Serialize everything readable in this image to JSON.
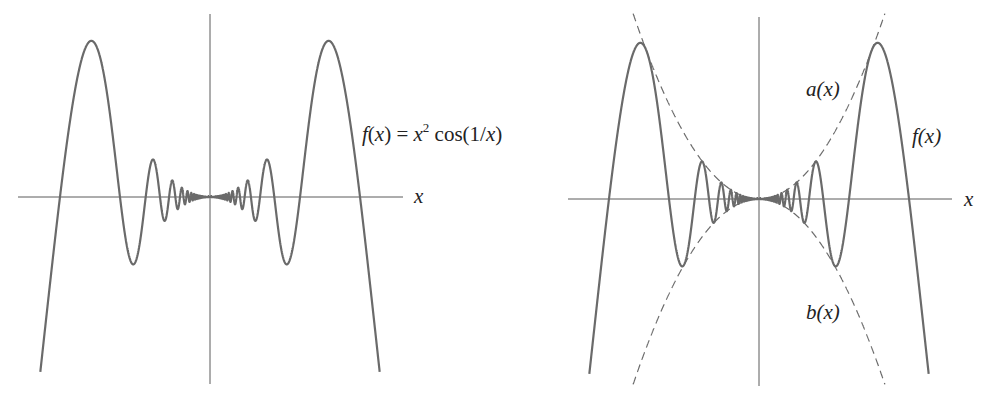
{
  "chart_data": [
    {
      "type": "line",
      "panel": "left",
      "title": "",
      "xlabel": "x",
      "ylabel": "",
      "annotations": [
        "f(x) = x^2 cos(1/x)"
      ],
      "series": [
        {
          "name": "f(x) = x^2 cos(1/x)",
          "style": "solid",
          "x_range": [
            -0.24,
            0.24
          ]
        }
      ],
      "xlim": [
        -0.27,
        0.27
      ],
      "grid": false,
      "legend": "none"
    },
    {
      "type": "line",
      "panel": "right",
      "title": "",
      "xlabel": "x",
      "ylabel": "",
      "annotations": [
        "a(x)",
        "f(x)",
        "b(x)"
      ],
      "series": [
        {
          "name": "f(x)",
          "style": "solid",
          "x_range": [
            -0.24,
            0.24
          ]
        },
        {
          "name": "a(x) = x^2",
          "style": "dashed",
          "x_range": [
            -0.178,
            0.178
          ]
        },
        {
          "name": "b(x) = -x^2",
          "style": "dashed",
          "x_range": [
            -0.178,
            0.178
          ]
        }
      ],
      "xlim": [
        -0.27,
        0.27
      ],
      "grid": false,
      "legend": "none"
    }
  ],
  "panels": {
    "left": {
      "x_label": "x",
      "func_label": {
        "f": "f",
        "arg": "(x) = x",
        "sup": "2",
        "rest": " cos(1/",
        "var": "x",
        "close": ")"
      }
    },
    "right": {
      "x_label": "x",
      "a_label": "a(x)",
      "f_label": "f(x)",
      "b_label": "b(x)"
    }
  },
  "layout": {
    "scale_x": 707,
    "scale_y": 5850,
    "left_origin": [
      210,
      197
    ],
    "right_origin": [
      759,
      199
    ]
  }
}
